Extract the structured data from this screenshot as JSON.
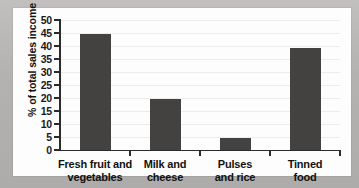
{
  "chart_data": {
    "type": "bar",
    "title": "",
    "subtitle": "",
    "xlabel": "",
    "ylabel": "% of total sales income",
    "categories": [
      "Fresh fruit and vegetables",
      "Milk and cheese",
      "Pulses and rice",
      "Tinned food"
    ],
    "category_lines": [
      [
        "Fresh fruit and",
        "vegetables"
      ],
      [
        "Milk and",
        "cheese"
      ],
      [
        "Pulses",
        "and rice"
      ],
      [
        "Tinned",
        "food"
      ]
    ],
    "values": [
      44.7,
      19.7,
      4.6,
      39.4
    ],
    "ylim": [
      0,
      50
    ],
    "ytick_step": 5,
    "ytick_labels": [
      "0",
      "5",
      "10",
      "15",
      "20",
      "25",
      "30",
      "35",
      "40",
      "45",
      "50"
    ],
    "grid": true,
    "grid_axis": "y",
    "legend": false,
    "legend_position": "none",
    "bar_color": "#434241",
    "axis_color": "#2b2b2b",
    "gridline_color": "#ececec",
    "panel_background": "#fdfdfd",
    "figure_background": "#b7b5b4"
  },
  "figure": {
    "background_color": "#b7b5b4",
    "panel_color": "#fdfdfd"
  }
}
